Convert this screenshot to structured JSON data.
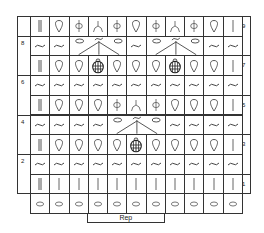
{
  "chart_data": {
    "type": "table",
    "columns": 11,
    "rows": [
      {
        "row": 9,
        "side": "right",
        "cells": [
          "dbl-bar",
          "drop",
          "phi",
          "yfork",
          "phi",
          "drop",
          "phi",
          "yfork",
          "phi",
          "drop",
          "bar"
        ]
      },
      {
        "row": 8,
        "side": "left",
        "cells": [
          "wave",
          "wave",
          "cluster3",
          "cluster3",
          "cluster3",
          "wave",
          "cluster3",
          "cluster3",
          "cluster3",
          "wave",
          "wave"
        ]
      },
      {
        "row": 7,
        "side": "right",
        "cells": [
          "dbl-bar",
          "drop",
          "drop",
          "bobble",
          "drop",
          "drop",
          "drop",
          "bobble",
          "drop",
          "drop",
          "bar"
        ]
      },
      {
        "row": 6,
        "side": "left",
        "cells": [
          "wave",
          "wave",
          "wave",
          "wave",
          "wave",
          "wave",
          "wave",
          "wave",
          "wave",
          "wave",
          "wave"
        ]
      },
      {
        "row": 5,
        "side": "right",
        "cells": [
          "dbl-bar",
          "drop",
          "drop",
          "drop",
          "phi",
          "yfork",
          "phi",
          "drop",
          "drop",
          "drop",
          "bar"
        ]
      },
      {
        "row": 4,
        "side": "left",
        "cells": [
          "wave",
          "wave",
          "wave",
          "wave",
          "cluster3",
          "cluster3",
          "cluster3",
          "wave",
          "wave",
          "wave",
          "wave"
        ]
      },
      {
        "row": 3,
        "side": "right",
        "cells": [
          "dbl-bar",
          "drop",
          "drop",
          "drop",
          "drop",
          "bobble",
          "drop",
          "drop",
          "drop",
          "drop",
          "bar"
        ]
      },
      {
        "row": 2,
        "side": "left",
        "cells": [
          "wave",
          "wave",
          "wave",
          "wave",
          "wave",
          "wave",
          "wave",
          "wave",
          "wave",
          "wave",
          "wave"
        ]
      },
      {
        "row": 1,
        "side": "right",
        "cells": [
          "dbl-bar",
          "bar",
          "bar",
          "bar",
          "bar",
          "bar",
          "bar",
          "bar",
          "bar",
          "bar",
          "bar"
        ]
      },
      {
        "row": "foundation",
        "side": "none",
        "cells": [
          "chain",
          "chain",
          "chain",
          "chain",
          "chain",
          "chain",
          "chain",
          "chain",
          "chain",
          "chain",
          "chain"
        ]
      }
    ],
    "clusters": [
      {
        "row": 8,
        "from_col": 3,
        "to_col": 5
      },
      {
        "row": 8,
        "from_col": 7,
        "to_col": 9
      },
      {
        "row": 4,
        "from_col": 5,
        "to_col": 7
      }
    ],
    "repeat": {
      "label": "Rep",
      "from_col": 4,
      "to_col": 7
    }
  },
  "labels": {
    "row_9": "9",
    "row_8": "8",
    "row_7": "7",
    "row_6": "6",
    "row_5": "5",
    "row_4": "4",
    "row_3": "3",
    "row_2": "2",
    "row_1": "1",
    "rep": "Rep"
  }
}
